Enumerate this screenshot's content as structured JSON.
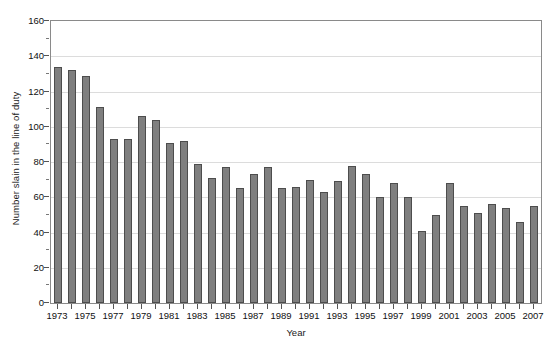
{
  "chart_data": {
    "type": "bar",
    "title": "",
    "xlabel": "Year",
    "ylabel": "Number slain in the line of duty",
    "ylim": [
      0,
      160
    ],
    "ytick_step": 20,
    "yticks": [
      0,
      20,
      40,
      60,
      80,
      100,
      120,
      140,
      160
    ],
    "ytick_labels": [
      "0",
      "20",
      "40",
      "60",
      "80",
      "100",
      "120",
      "140",
      "160"
    ],
    "grid": true,
    "legend": null,
    "bar_color": "#7f7f7f",
    "bar_border_color": "#4d4d4d",
    "grid_color": "#dcdcdc",
    "axis_color": "#8a8a8a",
    "categories": [
      "1973",
      "1974",
      "1975",
      "1976",
      "1977",
      "1978",
      "1979",
      "1980",
      "1981",
      "1982",
      "1983",
      "1984",
      "1985",
      "1986",
      "1987",
      "1988",
      "1989",
      "1990",
      "1991",
      "1992",
      "1993",
      "1994",
      "1995",
      "1996",
      "1997",
      "1998",
      "1999",
      "2000",
      "2001",
      "2002",
      "2003",
      "2004",
      "2005",
      "2006",
      "2007"
    ],
    "values": [
      134,
      132,
      129,
      111,
      93,
      93,
      106,
      104,
      91,
      92,
      79,
      71,
      77,
      65,
      73,
      77,
      65,
      66,
      70,
      63,
      69,
      78,
      73,
      60,
      68,
      60,
      41,
      50,
      68,
      55,
      51,
      56,
      54,
      46,
      55
    ],
    "xtick_labels_shown": [
      "1973",
      "1975",
      "1977",
      "1979",
      "1981",
      "1983",
      "1985",
      "1987",
      "1989",
      "1991",
      "1993",
      "1995",
      "1997",
      "1999",
      "2001",
      "2003",
      "2005",
      "2007"
    ]
  }
}
